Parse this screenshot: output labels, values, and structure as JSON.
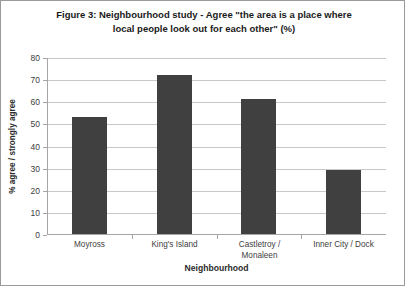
{
  "figure": {
    "title_line1": "Figure 3: Neighbourhood study - Agree \"the area is a place where",
    "title_line2": "local people look out for each other\" (%)",
    "border_color": "#9a9a9a"
  },
  "chart_data": {
    "type": "bar",
    "title": "Figure 3: Neighbourhood study - Agree \"the area is a place where local people look out for each other\" (%)",
    "categories": [
      "Moyross",
      "King's Island",
      "Castletroy / Monaleen",
      "Inner City / Dock"
    ],
    "values": [
      53,
      72,
      61,
      29
    ],
    "xlabel": "Neighbourhood",
    "ylabel": "% agree / strongly agree",
    "ylim": [
      0,
      80
    ],
    "ytick_step": 10,
    "yticks": [
      0,
      10,
      20,
      30,
      40,
      50,
      60,
      70,
      80
    ],
    "ytick_labels": [
      "0",
      "10",
      "20",
      "30",
      "40",
      "50",
      "60",
      "70",
      "80"
    ],
    "grid": true,
    "legend": false,
    "bar_color": "#404040",
    "gridline_color": "#c8c8c8",
    "axis_color": "#a6a6a6",
    "category_labels_wrapped": [
      [
        "Moyross"
      ],
      [
        "King's Island"
      ],
      [
        "Castletroy /",
        "Monaleen"
      ],
      [
        "Inner City / Dock"
      ]
    ]
  }
}
